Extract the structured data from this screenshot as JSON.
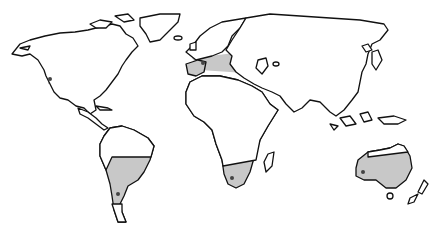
{
  "map": {
    "type": "world-outline-map",
    "background": "#ffffff",
    "outline_color": "#111111",
    "shade_color": "#c8c8c8",
    "marker_color": "#444444",
    "regions": [
      {
        "id": "north-america",
        "label": "",
        "marker": [
          48,
          77
        ]
      },
      {
        "id": "mediterranean-asia",
        "label": "",
        "marker": [
          204,
          64
        ]
      },
      {
        "id": "south-america",
        "label": "",
        "marker": [
          118,
          194
        ]
      },
      {
        "id": "southern-africa",
        "label": "",
        "marker": [
          232,
          178
        ]
      },
      {
        "id": "australia",
        "label": "",
        "marker": [
          363,
          172
        ]
      }
    ]
  }
}
